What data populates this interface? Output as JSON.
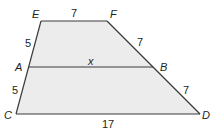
{
  "diagram": {
    "type": "trapezoid-with-midsegment",
    "colors": {
      "fill": "#ececec",
      "stroke": "#3a3a3a",
      "text": "#231f20"
    },
    "vertices": {
      "E": {
        "label": "E",
        "x": 41,
        "y": 21
      },
      "F": {
        "label": "F",
        "x": 107,
        "y": 21
      },
      "A": {
        "label": "A",
        "x": 29,
        "y": 67
      },
      "B": {
        "label": "B",
        "x": 153,
        "y": 67
      },
      "C": {
        "label": "C",
        "x": 16,
        "y": 114
      },
      "D": {
        "label": "D",
        "x": 200,
        "y": 114
      }
    },
    "segments": {
      "EF": {
        "label": "7"
      },
      "EA": {
        "label": "5"
      },
      "AC": {
        "label": "5"
      },
      "FB": {
        "label": "7"
      },
      "BD": {
        "label": "7"
      },
      "AB": {
        "label": "x"
      },
      "CD": {
        "label": "17"
      }
    }
  }
}
